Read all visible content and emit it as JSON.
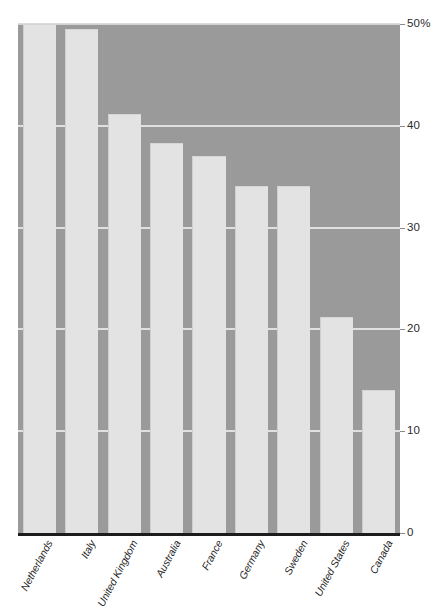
{
  "chart_data": {
    "type": "bar",
    "title": "",
    "subtitle": "",
    "xlabel": "",
    "ylabel": "",
    "ylim": [
      0,
      50
    ],
    "grid": true,
    "legend": "none",
    "orientation": "vertical",
    "categories": [
      "Netherlands",
      "Italy",
      "United Kingdom",
      "Australia",
      "France",
      "Germany",
      "Sweden",
      "United States",
      "Canada"
    ],
    "values": [
      50.0,
      49.5,
      41.2,
      38.3,
      37.0,
      34.1,
      34.1,
      21.2,
      14.0
    ],
    "ytick_labels": [
      "50%",
      "40",
      "30",
      "20",
      "10",
      "0"
    ],
    "ytick_values": [
      50,
      40,
      30,
      20,
      10,
      0
    ],
    "colors": {
      "bar": "#e3e3e3",
      "plot_background": "#9a9a9a",
      "gridline": "#e8e8e8",
      "axis": "#1c1c1c",
      "text": "#1f1f1f",
      "page_background": "#ffffff"
    }
  }
}
